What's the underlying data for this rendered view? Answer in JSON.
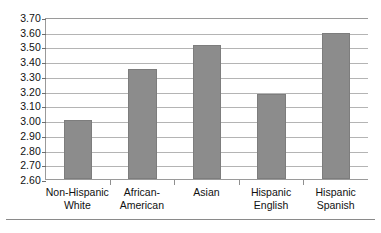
{
  "chart_data": {
    "type": "bar",
    "title": "",
    "xlabel": "",
    "ylabel": "",
    "categories": [
      "Non-Hispanic White",
      "African-American",
      "Asian",
      "Hispanic English",
      "Hispanic Spanish"
    ],
    "category_lines": [
      [
        "Non-Hispanic",
        "White"
      ],
      [
        "African-",
        "American"
      ],
      [
        "Asian",
        ""
      ],
      [
        "Hispanic",
        "English"
      ],
      [
        "Hispanic",
        "Spanish"
      ]
    ],
    "values": [
      3.0,
      3.35,
      3.51,
      3.18,
      3.59
    ],
    "ylim": [
      2.6,
      3.7
    ],
    "ytick_step": 0.1,
    "ytick_labels": [
      "3.70",
      "3.60",
      "3.50",
      "3.40",
      "3.30",
      "3.20",
      "3.10",
      "3.00",
      "2.90",
      "2.80",
      "2.70",
      "2.60"
    ],
    "grid": true,
    "legend": false,
    "bar_color": "#8c8c8c",
    "grid_color": "#b4b4b4",
    "axis_color": "#9a9a9a"
  }
}
